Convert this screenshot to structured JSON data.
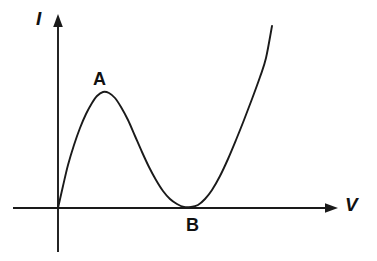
{
  "figure": {
    "axes": {
      "y_label": "I",
      "x_label": "V",
      "y_label_name": "current-axis-label",
      "x_label_name": "voltage-axis-label"
    },
    "annotations": [
      {
        "label": "A",
        "role": "peak-point-label"
      },
      {
        "label": "B",
        "role": "valley-point-label"
      }
    ],
    "colors": {
      "stroke": "#1a1a1a",
      "text": "#111111",
      "background": "#ffffff"
    }
  },
  "chart_data": {
    "type": "line",
    "title": "",
    "xlabel": "V",
    "ylabel": "I",
    "grid": false,
    "legend": null,
    "axis_origin": {
      "x": 58,
      "y": 208
    },
    "xlim": [
      13,
      337
    ],
    "ylim": [
      16,
      252
    ],
    "annotations": [
      {
        "text": "A",
        "x": 103,
        "y": 92,
        "description": "local maximum (peak current)"
      },
      {
        "text": "B",
        "x": 191,
        "y": 207,
        "description": "local minimum (valley current) on the V axis"
      }
    ],
    "series": [
      {
        "name": "I(V)",
        "description": "N-shaped tunnel-diode style characteristic: rises from origin to peak A, falls to a minimum B on the axis, then rises steeply",
        "points": [
          [
            58,
            208
          ],
          [
            63,
            186
          ],
          [
            68,
            165
          ],
          [
            74,
            145
          ],
          [
            80,
            128
          ],
          [
            86,
            114
          ],
          [
            92,
            103
          ],
          [
            97,
            96
          ],
          [
            103,
            92
          ],
          [
            109,
            93
          ],
          [
            115,
            98
          ],
          [
            121,
            107
          ],
          [
            128,
            120
          ],
          [
            135,
            136
          ],
          [
            142,
            152
          ],
          [
            149,
            167
          ],
          [
            156,
            180
          ],
          [
            163,
            191
          ],
          [
            170,
            199
          ],
          [
            177,
            204
          ],
          [
            184,
            207
          ],
          [
            191,
            207
          ],
          [
            198,
            205
          ],
          [
            205,
            199
          ],
          [
            212,
            190
          ],
          [
            220,
            176
          ],
          [
            228,
            159
          ],
          [
            236,
            140
          ],
          [
            244,
            120
          ],
          [
            252,
            99
          ],
          [
            260,
            77
          ],
          [
            266,
            58
          ],
          [
            272,
            26
          ]
        ]
      }
    ]
  }
}
